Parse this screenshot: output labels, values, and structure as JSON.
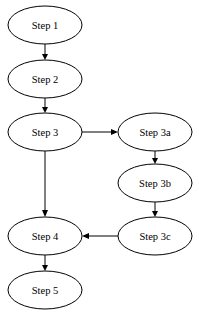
{
  "diagram": {
    "type": "flowchart",
    "nodes": [
      {
        "id": "step1",
        "label": "Step 1",
        "cx": 45,
        "cy": 25
      },
      {
        "id": "step2",
        "label": "Step 2",
        "cx": 45,
        "cy": 79
      },
      {
        "id": "step3",
        "label": "Step 3",
        "cx": 45,
        "cy": 132
      },
      {
        "id": "step3a",
        "label": "Step 3a",
        "cx": 155,
        "cy": 132
      },
      {
        "id": "step3b",
        "label": "Step 3b",
        "cx": 155,
        "cy": 183
      },
      {
        "id": "step3c",
        "label": "Step 3c",
        "cx": 155,
        "cy": 236
      },
      {
        "id": "step4",
        "label": "Step 4",
        "cx": 45,
        "cy": 236
      },
      {
        "id": "step5",
        "label": "Step 5",
        "cx": 45,
        "cy": 290
      }
    ],
    "edges": [
      {
        "from": "step1",
        "to": "step2"
      },
      {
        "from": "step2",
        "to": "step3"
      },
      {
        "from": "step3",
        "to": "step3a"
      },
      {
        "from": "step3",
        "to": "step4"
      },
      {
        "from": "step3a",
        "to": "step3b"
      },
      {
        "from": "step3b",
        "to": "step3c"
      },
      {
        "from": "step3c",
        "to": "step4"
      },
      {
        "from": "step4",
        "to": "step5"
      }
    ]
  }
}
